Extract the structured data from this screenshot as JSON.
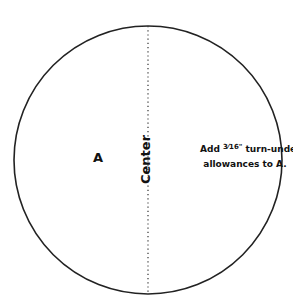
{
  "diagram": {
    "piece_label": "A",
    "center_label": "Center",
    "note": {
      "line1_prefix": "Add ",
      "fraction": "3⁄16",
      "unit": "\"",
      "line1_suffix": " turn-under",
      "line2": "allowances to A."
    },
    "colors": {
      "outline": "#222222",
      "text": "#111111",
      "background": "#ffffff"
    }
  }
}
